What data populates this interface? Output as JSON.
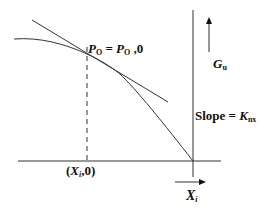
{
  "labels": {
    "p0": {
      "lhs": "P",
      "lhs_sub": "O",
      "eq": " = ",
      "rhs": "P",
      "rhs_sub": "O",
      "tail": " ,0"
    },
    "gu": {
      "sym": "G",
      "sub": "u"
    },
    "slope": {
      "text": "Slope = ",
      "sym": "K",
      "sub": "nx"
    },
    "xi0": {
      "open": "(",
      "sym": "X",
      "sub": "i",
      "tail": ",0)"
    },
    "xi": {
      "sym": "X",
      "sub": "i"
    }
  },
  "colors": {
    "line": "#333333",
    "background": "#ffffff"
  }
}
